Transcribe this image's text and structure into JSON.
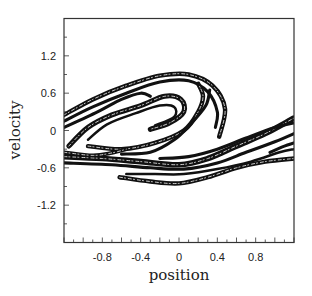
{
  "chart_data": {
    "type": "scatter",
    "title": "",
    "xlabel": "position",
    "ylabel": "velocity",
    "xlim": [
      -1.2,
      1.2
    ],
    "ylim": [
      -1.8,
      1.8
    ],
    "xticks": [
      -0.8,
      -0.4,
      0,
      0.4,
      0.8
    ],
    "xtick_labels": [
      "-0.8",
      "-0.4",
      "0",
      "0.4",
      "0.8"
    ],
    "yticks": [
      1.2,
      0.6,
      0,
      -0.6,
      -1.2
    ],
    "ytick_labels": [
      "1.2",
      "0.6",
      "0",
      "-0.6",
      "-1.2"
    ],
    "grid": false,
    "legend": null,
    "series": [
      {
        "name": "upper-outer-band",
        "width": 0.07,
        "points": [
          [
            -1.2,
            0.25
          ],
          [
            -0.9,
            0.5
          ],
          [
            -0.55,
            0.72
          ],
          [
            -0.2,
            0.88
          ],
          [
            0.1,
            0.9
          ],
          [
            0.35,
            0.72
          ],
          [
            0.48,
            0.35
          ],
          [
            0.42,
            -0.1
          ]
        ]
      },
      {
        "name": "upper-band-2",
        "width": 0.05,
        "points": [
          [
            -1.2,
            0.15
          ],
          [
            -0.9,
            0.38
          ],
          [
            -0.55,
            0.6
          ],
          [
            -0.2,
            0.78
          ],
          [
            0.1,
            0.8
          ],
          [
            0.3,
            0.62
          ],
          [
            0.4,
            0.3
          ],
          [
            0.38,
            0.05
          ]
        ]
      },
      {
        "name": "upper-band-3",
        "width": 0.05,
        "points": [
          [
            -1.2,
            0.05
          ],
          [
            -0.85,
            0.3
          ],
          [
            -0.6,
            0.5
          ],
          [
            -0.4,
            0.6
          ],
          [
            -0.3,
            0.55
          ]
        ]
      },
      {
        "name": "inner-spiral",
        "width": 0.08,
        "points": [
          [
            -1.15,
            -0.25
          ],
          [
            -0.95,
            0.05
          ],
          [
            -0.7,
            0.25
          ],
          [
            -0.4,
            0.4
          ],
          [
            -0.15,
            0.55
          ],
          [
            0.02,
            0.5
          ],
          [
            0.05,
            0.3
          ],
          [
            -0.1,
            0.12
          ],
          [
            -0.3,
            0.02
          ]
        ]
      },
      {
        "name": "inner-spiral-2",
        "width": 0.04,
        "points": [
          [
            -0.95,
            -0.15
          ],
          [
            -0.75,
            0.1
          ],
          [
            -0.45,
            0.28
          ],
          [
            -0.2,
            0.4
          ],
          [
            -0.05,
            0.38
          ],
          [
            -0.05,
            0.22
          ],
          [
            -0.25,
            0.08
          ]
        ]
      },
      {
        "name": "middle-s-band",
        "width": 0.07,
        "points": [
          [
            -0.95,
            -0.25
          ],
          [
            -0.6,
            -0.3
          ],
          [
            -0.25,
            -0.2
          ],
          [
            0.05,
            0.0
          ],
          [
            0.2,
            0.3
          ],
          [
            0.25,
            0.55
          ],
          [
            0.2,
            0.75
          ]
        ]
      },
      {
        "name": "middle-s-band-2",
        "width": 0.05,
        "points": [
          [
            -0.6,
            -0.38
          ],
          [
            -0.3,
            -0.35
          ],
          [
            -0.05,
            -0.15
          ],
          [
            0.12,
            0.1
          ],
          [
            0.28,
            0.4
          ],
          [
            0.32,
            0.65
          ]
        ]
      },
      {
        "name": "lower-s-band",
        "width": 0.09,
        "points": [
          [
            -1.2,
            -0.42
          ],
          [
            -0.8,
            -0.45
          ],
          [
            -0.4,
            -0.5
          ],
          [
            0.0,
            -0.55
          ],
          [
            0.3,
            -0.45
          ],
          [
            0.6,
            -0.25
          ],
          [
            0.9,
            -0.05
          ],
          [
            1.2,
            0.2
          ]
        ]
      },
      {
        "name": "lower-s-band-2",
        "width": 0.05,
        "points": [
          [
            -1.2,
            -0.52
          ],
          [
            -0.7,
            -0.55
          ],
          [
            -0.3,
            -0.6
          ],
          [
            0.05,
            -0.62
          ],
          [
            0.4,
            -0.52
          ],
          [
            0.7,
            -0.35
          ],
          [
            1.0,
            -0.18
          ],
          [
            1.2,
            -0.05
          ]
        ]
      },
      {
        "name": "lower-s-band-3",
        "width": 0.05,
        "points": [
          [
            -0.2,
            -0.45
          ],
          [
            0.1,
            -0.42
          ],
          [
            0.4,
            -0.3
          ],
          [
            0.7,
            -0.12
          ],
          [
            1.0,
            0.05
          ],
          [
            1.2,
            0.12
          ]
        ]
      },
      {
        "name": "bottom-lobe",
        "width": 0.07,
        "points": [
          [
            -0.62,
            -0.75
          ],
          [
            -0.3,
            -0.82
          ],
          [
            0.0,
            -0.85
          ],
          [
            0.3,
            -0.75
          ],
          [
            0.6,
            -0.6
          ],
          [
            0.9,
            -0.5
          ],
          [
            1.2,
            -0.45
          ]
        ]
      },
      {
        "name": "bottom-lobe-2",
        "width": 0.04,
        "points": [
          [
            -0.55,
            -0.7
          ],
          [
            -0.25,
            -0.7
          ],
          [
            0.05,
            -0.7
          ],
          [
            0.4,
            -0.62
          ],
          [
            0.75,
            -0.5
          ],
          [
            1.05,
            -0.35
          ],
          [
            1.2,
            -0.3
          ]
        ]
      },
      {
        "name": "left-bundle",
        "width": 0.06,
        "points": [
          [
            -1.2,
            -0.35
          ],
          [
            -0.9,
            -0.4
          ],
          [
            -0.7,
            -0.36
          ],
          [
            -0.55,
            -0.3
          ]
        ]
      },
      {
        "name": "right-tail",
        "width": 0.05,
        "points": [
          [
            0.95,
            -0.35
          ],
          [
            1.1,
            -0.25
          ],
          [
            1.2,
            -0.2
          ]
        ]
      }
    ]
  }
}
